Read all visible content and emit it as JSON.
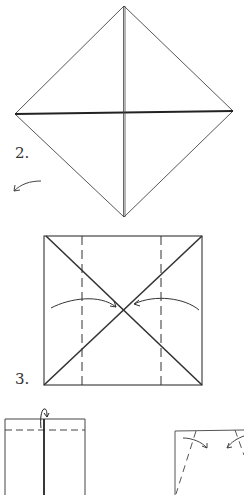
{
  "diagram": {
    "type": "origami-instructions",
    "steps": [
      {
        "id": "step-2",
        "label": "2.",
        "shape": "diamond",
        "description": "Square turned as diamond with horizontal and vertical creases; turn-over arrow"
      },
      {
        "id": "step-3",
        "label": "3.",
        "shape": "square",
        "description": "Square with diagonal creases and two vertical dashed fold lines; arrows fold sides to center"
      },
      {
        "id": "step-4",
        "label": "",
        "shape": "rectangle",
        "description": "Folded rectangle with center line, top dashed fold line and fold-behind arrow"
      },
      {
        "id": "step-5",
        "label": "",
        "shape": "partial-rectangle",
        "description": "Partial shape with angled dashed fold lines and inward arrows"
      }
    ],
    "colors": {
      "line": "#333333",
      "background": "#ffffff"
    }
  }
}
